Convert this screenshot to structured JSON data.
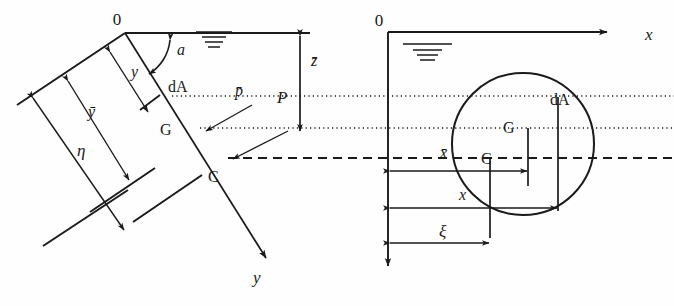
{
  "figure": {
    "domain": "engineering-diagram",
    "background_color": "#fefefe",
    "line_color": "#1a1a1a"
  },
  "left_panel": {
    "name": "inclined-plane-side-view",
    "origin_label": "0",
    "angle_label": "a",
    "axis_label_y": "y",
    "distance_labels": {
      "y": "y",
      "y_bar": "ȳ",
      "eta": "η",
      "z_bar": "z̄"
    },
    "point_labels": {
      "centroid": "G",
      "center_of_pressure": "C",
      "area_element": "dA",
      "mean_pressure": "p̄",
      "resultant_force": "P"
    },
    "water_surface_symbol": "free-surface-hatch"
  },
  "right_panel": {
    "name": "plane-true-shape-view",
    "origin_label": "0",
    "axis_label_x": "x",
    "shape": "circle",
    "point_labels": {
      "centroid": "G",
      "center_of_pressure": "C",
      "area_element": "dA"
    },
    "distance_labels": {
      "x_bar": "x̄",
      "x": "x",
      "xi": "ξ"
    },
    "water_surface_symbol": "free-surface-hatch"
  }
}
